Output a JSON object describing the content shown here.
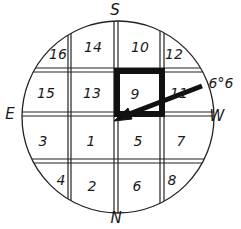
{
  "directions": {
    "top": "S",
    "bottom": "N",
    "left": "E",
    "right": "W"
  },
  "cells": [
    {
      "label": "16",
      "x": 69,
      "y": 48
    },
    {
      "label": "14",
      "x": 94,
      "y": 47
    },
    {
      "label": "10",
      "x": 140,
      "y": 47
    },
    {
      "label": "12",
      "x": 172,
      "y": 52
    },
    {
      "label": "15",
      "x": 48,
      "y": 93
    },
    {
      "label": "13",
      "x": 93,
      "y": 93
    },
    {
      "label": "9",
      "x": 135,
      "y": 94
    },
    {
      "label": "11",
      "x": 178,
      "y": 94
    },
    {
      "label": "3",
      "x": 44,
      "y": 141
    },
    {
      "label": "1",
      "x": 92,
      "y": 141
    },
    {
      "label": "5",
      "x": 138,
      "y": 141
    },
    {
      "label": "7",
      "x": 181,
      "y": 141
    },
    {
      "label": "4",
      "x": 62,
      "y": 180
    },
    {
      "label": "2",
      "x": 93,
      "y": 187
    },
    {
      "label": "6",
      "x": 138,
      "y": 187
    },
    {
      "label": "8",
      "x": 174,
      "y": 181
    }
  ],
  "annotation": {
    "label": "6°6",
    "x": 219,
    "y": 81
  },
  "highlight_cell": "9"
}
